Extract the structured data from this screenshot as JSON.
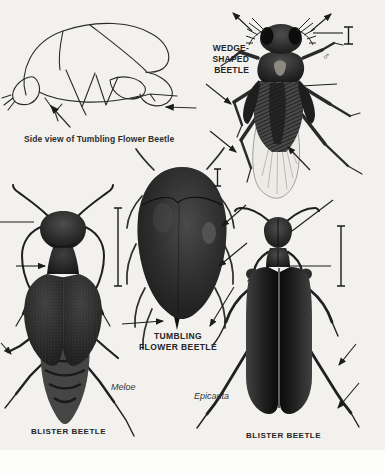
{
  "page": {
    "background": "#f2f1ee",
    "paper": "#ffffff",
    "ink": "#1f1f1f"
  },
  "figures": {
    "side_view": {
      "caption": "Side view of Tumbling Flower Beetle"
    },
    "wedge_shaped_beetle": {
      "label_line1": "WEDGE-",
      "label_line2": "SHAPED",
      "label_line3": "BEETLE",
      "sex_symbol": "♂"
    },
    "tumbling_flower_beetle": {
      "label_line1": "TUMBLING",
      "label_line2": "FLOWER BEETLE"
    },
    "blister_beetle_meloe": {
      "genus": "Meloe",
      "label": "BLISTER BEETLE"
    },
    "blister_beetle_epicauta": {
      "genus": "Epicauta",
      "label": "BLISTER BEETLE"
    }
  }
}
